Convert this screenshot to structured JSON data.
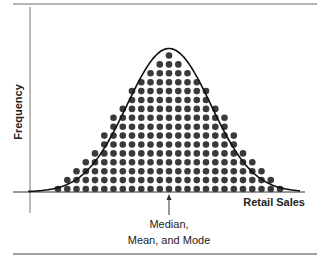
{
  "chart_data": {
    "type": "scatter",
    "subtype": "dot-histogram-with-normal-curve",
    "title": "",
    "xlabel": "Retail Sales",
    "ylabel": "Frequency",
    "annotation": {
      "line1": "Median,",
      "line2": "Mean, and Mode",
      "points_to": "center of distribution"
    },
    "column_counts": [
      1,
      2,
      3,
      4,
      5,
      7,
      9,
      10,
      12,
      13,
      14,
      15,
      16,
      15,
      14,
      13,
      12,
      10,
      9,
      7,
      5,
      4,
      3,
      2,
      1
    ],
    "curve": "normal (symmetric bell)",
    "grid": false,
    "legend": "none",
    "colors": {
      "dots": "#3a3a3a",
      "curve": "#111111",
      "axes": "#555555"
    }
  }
}
